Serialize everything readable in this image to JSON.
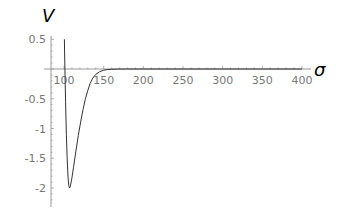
{
  "chart_data": {
    "type": "line",
    "title": "",
    "xlabel": "σ",
    "ylabel": "V",
    "xlim": [
      92,
      410
    ],
    "ylim": [
      -2.3,
      0.55
    ],
    "grid": false,
    "legend": null,
    "x_ticks": [
      100,
      150,
      200,
      250,
      300,
      350,
      400
    ],
    "x_tick_labels": [
      "100",
      "150",
      "200",
      "250",
      "300",
      "350",
      "400"
    ],
    "y_ticks": [
      0.5,
      -0.5,
      -1,
      -1.5,
      -2
    ],
    "y_tick_labels": [
      "0.5",
      "-0.5",
      "-1",
      "-1.5",
      "-2"
    ],
    "series": [
      {
        "name": "V(σ)",
        "x": [
          100.5,
          101,
          102,
          103,
          104,
          105,
          106,
          107,
          108,
          110,
          112,
          115,
          118,
          121,
          124,
          127,
          130,
          133,
          136,
          140,
          145,
          150,
          155,
          160,
          170,
          180,
          200,
          250,
          300,
          350,
          400
        ],
        "values": [
          0.5,
          0.1,
          -0.55,
          -1.1,
          -1.5,
          -1.8,
          -1.96,
          -2.0,
          -1.97,
          -1.83,
          -1.65,
          -1.38,
          -1.12,
          -0.89,
          -0.68,
          -0.5,
          -0.36,
          -0.24,
          -0.16,
          -0.09,
          -0.045,
          -0.02,
          -0.009,
          -0.004,
          -0.001,
          0,
          0,
          0,
          0,
          0,
          0
        ]
      }
    ]
  },
  "axes": {
    "x_title": "σ",
    "y_title": "V"
  },
  "colors": {
    "curve": "#333333",
    "axis": "#999999",
    "tick_text": "#777777"
  }
}
